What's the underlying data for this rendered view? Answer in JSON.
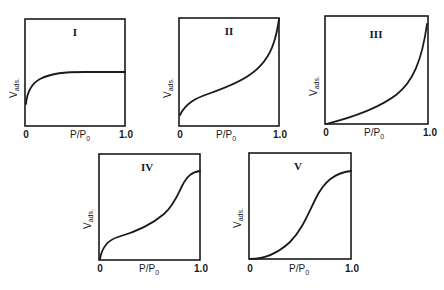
{
  "figure": {
    "y_axis_label": "V",
    "y_axis_sub": "ads.",
    "x_axis_label": "P/P",
    "x_axis_sub": "0",
    "x_tick_min": "0",
    "x_tick_max": "1.0",
    "panels": [
      {
        "id": "I",
        "label": "I",
        "shape": "Langmuir: steep rise then plateau"
      },
      {
        "id": "II",
        "label": "II",
        "shape": "sigmoidal, knee then rising to saturation"
      },
      {
        "id": "III",
        "label": "III",
        "shape": "convex, exponential-like rise"
      },
      {
        "id": "IV",
        "label": "IV",
        "shape": "knee, gradual rise, capillary step, plateau"
      },
      {
        "id": "V",
        "label": "V",
        "shape": "convex start, S-shaped rise, plateau"
      }
    ]
  }
}
